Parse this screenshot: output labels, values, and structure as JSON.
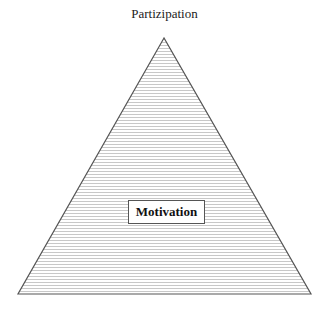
{
  "diagram": {
    "type": "pyramid",
    "apex_label": "Partizipation",
    "center_label": "Motivation",
    "fill_pattern": "horizontal-stripes",
    "colors": {
      "stripe": "#c8c8c8",
      "background": "#ffffff",
      "outline": "#555555"
    }
  }
}
